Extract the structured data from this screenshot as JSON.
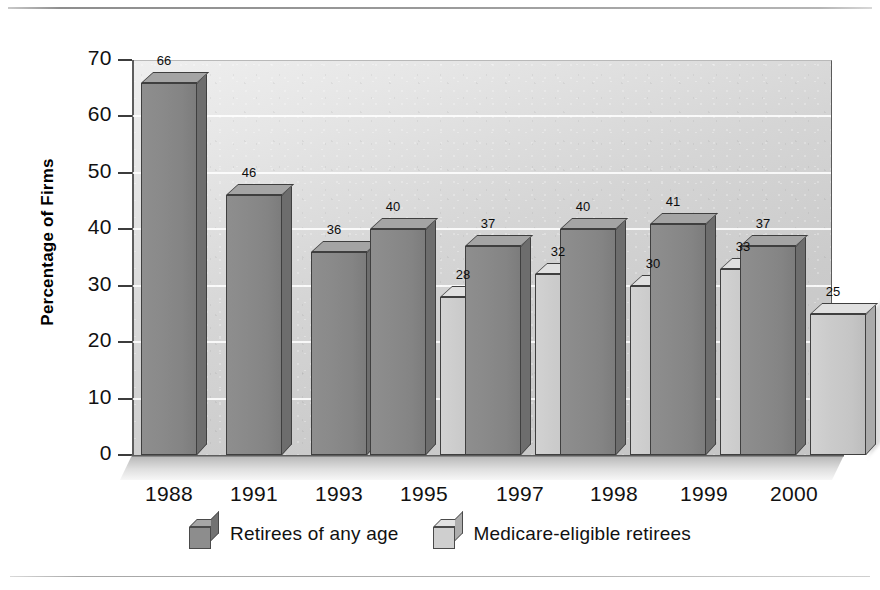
{
  "chart_data": {
    "type": "bar",
    "title": "",
    "xlabel": "",
    "ylabel": "Percentage of Firms",
    "ylim": [
      0,
      70
    ],
    "ytick_step": 10,
    "yticks": [
      "0",
      "10",
      "20",
      "30",
      "40",
      "50",
      "60",
      "70"
    ],
    "grid": true,
    "legend_position": "bottom",
    "style": "3d-column",
    "categories": [
      "1988",
      "1991",
      "1993",
      "1995",
      "1997",
      "1998",
      "1999",
      "2000"
    ],
    "series": [
      {
        "name": "Retirees of any age",
        "color": "#8a8a8a",
        "values": [
          66,
          46,
          36,
          40,
          37,
          40,
          41,
          37
        ]
      },
      {
        "name": "Medicare-eligible retirees",
        "color": "#c8c8c8",
        "values": [
          null,
          null,
          null,
          28,
          32,
          30,
          33,
          25
        ]
      }
    ],
    "data_labels": [
      {
        "category": "1988",
        "series": "Retirees of any age",
        "value": "66"
      },
      {
        "category": "1991",
        "series": "Retirees of any age",
        "value": "46"
      },
      {
        "category": "1993",
        "series": "Retirees of any age",
        "value": "36"
      },
      {
        "category": "1995",
        "series": "Retirees of any age",
        "value": "40"
      },
      {
        "category": "1995",
        "series": "Medicare-eligible retirees",
        "value": "28"
      },
      {
        "category": "1997",
        "series": "Retirees of any age",
        "value": "37"
      },
      {
        "category": "1997",
        "series": "Medicare-eligible retirees",
        "value": "32"
      },
      {
        "category": "1998",
        "series": "Retirees of any age",
        "value": "40"
      },
      {
        "category": "1998",
        "series": "Medicare-eligible retirees",
        "value": "30"
      },
      {
        "category": "1999",
        "series": "Retirees of any age",
        "value": "41"
      },
      {
        "category": "1999",
        "series": "Medicare-eligible retirees",
        "value": "33"
      },
      {
        "category": "2000",
        "series": "Retirees of any age",
        "value": "37"
      },
      {
        "category": "2000",
        "series": "Medicare-eligible retirees",
        "value": "25"
      }
    ]
  },
  "legend": {
    "items": [
      {
        "label": "Retirees of any age",
        "swatch": "cube-dark-icon"
      },
      {
        "label": "Medicare-eligible retirees",
        "swatch": "cube-light-icon"
      }
    ]
  }
}
